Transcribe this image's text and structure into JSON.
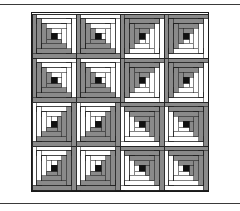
{
  "page": {
    "background_color": "#ffffff",
    "width": 240,
    "height": 211,
    "rule_color": "#3a3a3a"
  },
  "quilt": {
    "name": "log-cabin-barn-raising-quilt",
    "title": "Log Cabin Quilt — Barn Raising Setting",
    "x": 31,
    "y": 12,
    "width": 178,
    "height": 180,
    "grid_rows": 4,
    "grid_cols": 4,
    "block_size": 44,
    "logs_per_side": 4,
    "center_size": 6,
    "colors": {
      "light": "#ffffff",
      "dark": "#8a8a8a",
      "center": "#101010",
      "outline": "#1a1a1a",
      "border": "#1a1a1a"
    },
    "block_rotations": [
      [
        90,
        90,
        180,
        180
      ],
      [
        90,
        90,
        180,
        180
      ],
      [
        0,
        0,
        270,
        270
      ],
      [
        0,
        0,
        270,
        270
      ]
    ],
    "rotation_legend": {
      "0": "light-half-top-left",
      "90": "light-half-top-right",
      "180": "light-half-bottom-right",
      "270": "light-half-bottom-left"
    },
    "block_labels": [
      [
        "block-r1c1",
        "block-r1c2",
        "block-r1c3",
        "block-r1c4"
      ],
      [
        "block-r2c1",
        "block-r2c2",
        "block-r2c3",
        "block-r2c4"
      ],
      [
        "block-r3c1",
        "block-r3c2",
        "block-r3c3",
        "block-r3c4"
      ],
      [
        "block-r4c1",
        "block-r4c2",
        "block-r4c3",
        "block-r4c4"
      ]
    ]
  },
  "chart_data": {
    "type": "heatmap",
    "xlabel": "",
    "ylabel": "",
    "categories": [
      "col-1",
      "col-2",
      "col-3",
      "col-4"
    ],
    "rows": [
      "row-1",
      "row-2",
      "row-3",
      "row-4"
    ],
    "values": [
      [
        90,
        90,
        180,
        180
      ],
      [
        90,
        90,
        180,
        180
      ],
      [
        0,
        0,
        270,
        270
      ],
      [
        0,
        0,
        270,
        270
      ]
    ],
    "legend": [
      "light fabric",
      "dark fabric",
      "center square"
    ],
    "grid": false
  }
}
